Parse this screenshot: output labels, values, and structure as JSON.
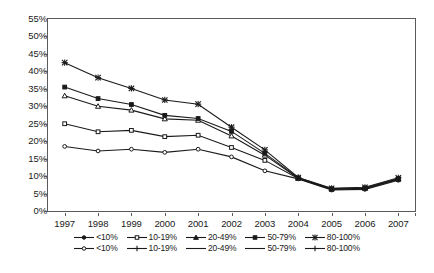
{
  "chart_data": {
    "type": "line",
    "title": "",
    "subtitle": "",
    "xlabel": "",
    "ylabel": "",
    "grid": false,
    "legend_position": "bottom",
    "x": [
      "1997",
      "1998",
      "1999",
      "2000",
      "2001",
      "2002",
      "2003",
      "2004",
      "2005",
      "2006",
      "2007"
    ],
    "categories": [
      "1997",
      "1998",
      "1999",
      "2000",
      "2001",
      "2002",
      "2003",
      "2004",
      "2005",
      "2006",
      "2007"
    ],
    "ylim": [
      0,
      55
    ],
    "ytick_labels": [
      "0%",
      "5%",
      "10%",
      "15%",
      "20%",
      "25%",
      "30%",
      "35%",
      "40%",
      "45%",
      "50%",
      "55%"
    ],
    "ytick_values": [
      0,
      5,
      10,
      15,
      20,
      25,
      30,
      35,
      40,
      45,
      50,
      55
    ],
    "series": [
      {
        "name": "<10%",
        "marker": "circle-open",
        "values": [
          18.5,
          17.2,
          17.7,
          16.8,
          17.7,
          15.5,
          11.5,
          9.2,
          6.0,
          6.2,
          8.8
        ]
      },
      {
        "name": "10-19%",
        "marker": "square-open",
        "values": [
          25.0,
          22.7,
          23.1,
          21.3,
          21.7,
          18.2,
          14.5,
          9.3,
          6.2,
          6.4,
          9.0
        ]
      },
      {
        "name": "20-49%",
        "marker": "triangle-open",
        "values": [
          33.0,
          30.0,
          28.9,
          26.4,
          26.0,
          21.5,
          16.0,
          9.4,
          6.3,
          6.5,
          9.2
        ]
      },
      {
        "name": "50-79%",
        "marker": "square-filled",
        "values": [
          35.5,
          32.2,
          30.5,
          27.4,
          26.5,
          22.8,
          16.5,
          9.5,
          6.4,
          6.6,
          9.3
        ]
      },
      {
        "name": "80-100%",
        "marker": "star",
        "values": [
          42.5,
          38.2,
          35.1,
          31.8,
          30.6,
          24.0,
          17.5,
          9.6,
          6.5,
          6.8,
          9.5
        ]
      }
    ]
  },
  "legend": {
    "rows": [
      {
        "entries": [
          {
            "label": "<10%",
            "marker": "circle-filled"
          },
          {
            "label": "10-19%",
            "marker": "square-open"
          },
          {
            "label": "20-49%",
            "marker": "triangle-filled"
          },
          {
            "label": "50-79%",
            "marker": "square-filled"
          },
          {
            "label": "80-100%",
            "marker": "star"
          }
        ]
      },
      {
        "entries": [
          {
            "label": "<10%",
            "marker": "circle-open"
          },
          {
            "label": "10-19%",
            "marker": "plus"
          },
          {
            "label": "20-49%",
            "marker": "line"
          },
          {
            "label": "50-79%",
            "marker": "line"
          },
          {
            "label": "80-100%",
            "marker": "plus-line"
          }
        ]
      }
    ]
  },
  "colors": {
    "line": "#1a1a1a",
    "axis": "#5a5a5a",
    "background": "#ffffff",
    "text": "#1a1a1a"
  }
}
